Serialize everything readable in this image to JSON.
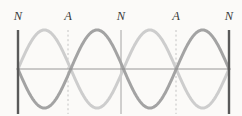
{
  "figure": {
    "name": "standing-wave-diagram",
    "background_color": "#fbfaf8",
    "width": 242,
    "height": 116
  },
  "labels": [
    {
      "text": "N",
      "x": 18,
      "meaning": "node"
    },
    {
      "text": "A",
      "x": 68,
      "meaning": "antinode"
    },
    {
      "text": "N",
      "x": 121,
      "meaning": "node"
    },
    {
      "text": "A",
      "x": 176,
      "meaning": "antinode"
    },
    {
      "text": "N",
      "x": 229,
      "meaning": "node"
    }
  ],
  "axis": {
    "y": 69,
    "x_start": 18,
    "x_end": 229,
    "color": "#8c8c8c",
    "width": 0.9
  },
  "boundaries": [
    {
      "x": 18,
      "y_top": 30,
      "y_bottom": 114,
      "color": "#5a5a5a",
      "width": 2.4
    },
    {
      "x": 229,
      "y_top": 30,
      "y_bottom": 114,
      "color": "#5a5a5a",
      "width": 2.4
    }
  ],
  "node_lines": [
    {
      "x": 121,
      "y_top": 30,
      "y_bottom": 114,
      "color": "#9a9a9a",
      "width": 0.9,
      "dashed": false
    }
  ],
  "antinode_lines": [
    {
      "x": 68,
      "y_top": 30,
      "y_bottom": 114,
      "color": "#bdbdbd",
      "width": 0.9,
      "dashed": true
    },
    {
      "x": 176,
      "y_top": 30,
      "y_bottom": 114,
      "color": "#bdbdbd",
      "width": 0.9,
      "dashed": true
    }
  ],
  "dash_pattern": "2,2.6",
  "chart_data": {
    "type": "line",
    "title": "",
    "xlabel": "",
    "ylabel": "",
    "grid": false,
    "legend": "none",
    "xlim": [
      18,
      229
    ],
    "ylim": [
      -1,
      1
    ],
    "axis_y_pixel": 69,
    "amplitude_pixels": 39,
    "wavelength_pixels": 105.5,
    "node_positions_x": [
      18,
      121,
      229
    ],
    "antinode_positions_x": [
      68,
      176
    ],
    "series": [
      {
        "name": "wave-light",
        "color": "#cdcdcd",
        "stroke_width": 3.0,
        "phase": "positive-first-half",
        "description": "Crest in left loop, trough in right loop",
        "samples_x": [
          18,
          31,
          44,
          55,
          68,
          81,
          94,
          108,
          121,
          134,
          147,
          160,
          176,
          189,
          202,
          216,
          229
        ],
        "samples_y": [
          0,
          0.61,
          0.94,
          1.0,
          1.0,
          0.94,
          0.61,
          0.19,
          0,
          -0.61,
          -0.94,
          -1.0,
          -1.0,
          -0.94,
          -0.61,
          -0.19,
          0
        ]
      },
      {
        "name": "wave-dark",
        "color": "#a3a3a3",
        "stroke_width": 3.0,
        "phase": "negative-first-half",
        "description": "Trough in left loop, crest in right loop",
        "samples_x": [
          18,
          31,
          44,
          55,
          68,
          81,
          94,
          108,
          121,
          134,
          147,
          160,
          176,
          189,
          202,
          216,
          229
        ],
        "samples_y": [
          0,
          -0.61,
          -0.94,
          -1.0,
          -1.0,
          -0.94,
          -0.61,
          -0.19,
          0,
          0.61,
          0.94,
          1.0,
          1.0,
          0.94,
          0.61,
          0.19,
          0
        ]
      }
    ]
  }
}
